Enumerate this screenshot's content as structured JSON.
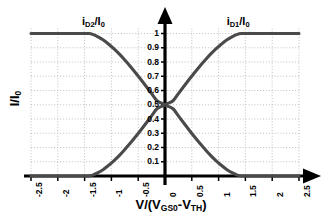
{
  "chart_data": {
    "type": "line",
    "title": "",
    "xlabel": "V/(VGS0-VTH)",
    "xlabel_parts": {
      "lead": "V/(V",
      "sub1": "GS0",
      "mid": "-V",
      "sub2": "TH",
      "tail": ")"
    },
    "ylabel": "I/I0",
    "ylabel_parts": {
      "lead": "I/I",
      "sub1": "0"
    },
    "xlim": [
      -2.5,
      2.5
    ],
    "ylim": [
      0,
      1
    ],
    "grid": true,
    "grid_style": "dotted",
    "grid_color": "#b9b9b9",
    "axis_color": "#000000",
    "curve_color": "#4a4a4a",
    "background_color": "#ffffff",
    "legend_position": "inline-top",
    "xticks": [
      "-2.5",
      "-2",
      "-1.5",
      "-1",
      "-0.5",
      "0",
      "0.5",
      "1",
      "1.5",
      "2",
      "2.5"
    ],
    "xtick_values": [
      -2.5,
      -2,
      -1.5,
      -1,
      -0.5,
      0,
      0.5,
      1,
      1.5,
      2,
      2.5
    ],
    "yticks": [
      "0.1",
      "0.2",
      "0.3",
      "0.4",
      "0.5",
      "0.6",
      "0.7",
      "0.8",
      "0.9",
      "1"
    ],
    "ytick_values": [
      0.1,
      0.2,
      0.3,
      0.4,
      0.5,
      0.6,
      0.7,
      0.8,
      0.9,
      1.0
    ],
    "annotations": [
      {
        "name": "id2-curve-label",
        "text": "iD2/I0",
        "parts": {
          "lead": "i",
          "sub1": "D2",
          "mid": "/I",
          "sub2": "0"
        },
        "x": -1.55,
        "y": 1.08
      },
      {
        "name": "id1-curve-label",
        "text": "iD1/I0",
        "parts": {
          "lead": "i",
          "sub1": "D1",
          "mid": "/I",
          "sub2": "0"
        },
        "x": 1.15,
        "y": 1.08
      }
    ],
    "series": [
      {
        "name": "iD1/I0",
        "color": "#4a4a4a",
        "x": [
          -2.5,
          -2.25,
          -2.0,
          -1.75,
          -1.5,
          -1.42,
          -1.35,
          -1.25,
          -1.15,
          -1.05,
          -0.95,
          -0.85,
          -0.75,
          -0.65,
          -0.55,
          -0.45,
          -0.35,
          -0.25,
          -0.15,
          -0.05,
          0.0,
          0.05,
          0.15,
          0.25,
          0.35,
          0.45,
          0.55,
          0.65,
          0.75,
          0.85,
          0.95,
          1.05,
          1.15,
          1.25,
          1.35,
          1.42,
          1.5,
          1.75,
          2.0,
          2.25,
          2.5
        ],
        "y": [
          0.0,
          0.0,
          0.0,
          0.0,
          0.0,
          0.0,
          0.006,
          0.023,
          0.046,
          0.075,
          0.108,
          0.145,
          0.186,
          0.229,
          0.275,
          0.323,
          0.372,
          0.422,
          0.472,
          0.491,
          0.5,
          0.509,
          0.528,
          0.578,
          0.628,
          0.677,
          0.725,
          0.771,
          0.814,
          0.855,
          0.892,
          0.925,
          0.954,
          0.977,
          0.994,
          1.0,
          1.0,
          1.0,
          1.0,
          1.0,
          1.0
        ]
      },
      {
        "name": "iD2/I0",
        "color": "#4a4a4a",
        "x": [
          -2.5,
          -2.25,
          -2.0,
          -1.75,
          -1.5,
          -1.42,
          -1.35,
          -1.25,
          -1.15,
          -1.05,
          -0.95,
          -0.85,
          -0.75,
          -0.65,
          -0.55,
          -0.45,
          -0.35,
          -0.25,
          -0.15,
          -0.05,
          0.0,
          0.05,
          0.15,
          0.25,
          0.35,
          0.45,
          0.55,
          0.65,
          0.75,
          0.85,
          0.95,
          1.05,
          1.15,
          1.25,
          1.35,
          1.42,
          1.5,
          1.75,
          2.0,
          2.25,
          2.5
        ],
        "y": [
          1.0,
          1.0,
          1.0,
          1.0,
          1.0,
          1.0,
          0.994,
          0.977,
          0.954,
          0.925,
          0.892,
          0.855,
          0.814,
          0.771,
          0.725,
          0.677,
          0.628,
          0.578,
          0.528,
          0.509,
          0.5,
          0.491,
          0.472,
          0.422,
          0.372,
          0.323,
          0.275,
          0.229,
          0.186,
          0.145,
          0.108,
          0.075,
          0.046,
          0.023,
          0.006,
          0.0,
          0.0,
          0.0,
          0.0,
          0.0,
          0.0
        ]
      }
    ]
  }
}
